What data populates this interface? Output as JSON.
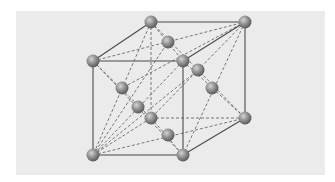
{
  "figure": {
    "background_color": "#ebebeb",
    "edge_color": "#4a4a4a",
    "dash_color": "#6a6a6a",
    "atom_color": "#8a8a8a"
  },
  "atoms": [
    {
      "id": "back-top-left",
      "x": 151,
      "y": 22
    },
    {
      "id": "back-top-right",
      "x": 245,
      "y": 22
    },
    {
      "id": "front-top-left",
      "x": 93,
      "y": 61
    },
    {
      "id": "front-top-right",
      "x": 183,
      "y": 61
    },
    {
      "id": "back-bottom-left",
      "x": 151,
      "y": 118
    },
    {
      "id": "back-bottom-right",
      "x": 245,
      "y": 118
    },
    {
      "id": "front-bottom-left",
      "x": 93,
      "y": 155
    },
    {
      "id": "front-bottom-right",
      "x": 183,
      "y": 155
    },
    {
      "id": "face-top",
      "x": 168,
      "y": 42
    },
    {
      "id": "face-back",
      "x": 198,
      "y": 70
    },
    {
      "id": "face-left",
      "x": 122,
      "y": 88
    },
    {
      "id": "face-right",
      "x": 212,
      "y": 88
    },
    {
      "id": "face-front",
      "x": 138,
      "y": 107
    },
    {
      "id": "face-bottom",
      "x": 168,
      "y": 135
    }
  ]
}
